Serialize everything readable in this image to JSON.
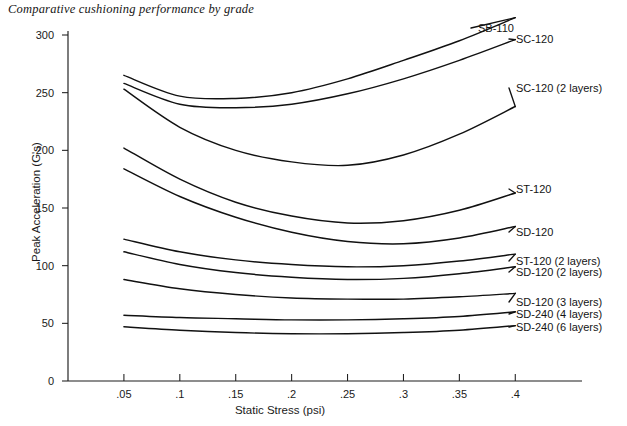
{
  "chart_data": {
    "type": "line",
    "title": "Comparative cushioning performance by grade",
    "xlabel": "Static Stress (psi)",
    "ylabel": "Peak Acceleration (G's)",
    "xlim": [
      0,
      0.44
    ],
    "ylim": [
      0,
      310
    ],
    "xticks": [
      0.05,
      0.1,
      0.15,
      0.2,
      0.25,
      0.3,
      0.35,
      0.4
    ],
    "xticklabels": [
      ".05",
      ".1",
      ".15",
      ".2",
      ".25",
      ".3",
      ".35",
      ".4"
    ],
    "yticks": [
      0,
      50,
      100,
      150,
      200,
      250,
      300
    ],
    "yticklabels": [
      "0",
      "50",
      "100",
      "150",
      "200",
      "250",
      "300"
    ],
    "grid": false,
    "legend_position": "right-inline-labels",
    "x": [
      0.05,
      0.1,
      0.15,
      0.2,
      0.25,
      0.3,
      0.35,
      0.4
    ],
    "series": [
      {
        "name": "SB-110",
        "label": "SB-110",
        "values": [
          265,
          247,
          245,
          250,
          262,
          278,
          295,
          315
        ]
      },
      {
        "name": "SC-120",
        "label": "SC-120",
        "values": [
          258,
          240,
          237,
          240,
          249,
          262,
          278,
          296
        ]
      },
      {
        "name": "SC-120 (2 layers)",
        "label": "SC-120 (2 layers)",
        "values": [
          253,
          220,
          200,
          190,
          187,
          196,
          214,
          238
        ]
      },
      {
        "name": "ST-120",
        "label": "ST-120",
        "values": [
          202,
          175,
          155,
          143,
          137,
          139,
          148,
          163
        ]
      },
      {
        "name": "SD-120",
        "label": "SD-120",
        "values": [
          184,
          160,
          142,
          129,
          121,
          119,
          124,
          134
        ]
      },
      {
        "name": "ST-120 (2 layers)",
        "label": "ST-120 (2 layers)",
        "values": [
          123,
          112,
          105,
          101,
          99,
          100,
          104,
          110
        ]
      },
      {
        "name": "SD-120 (2 layers)",
        "label": "SD-120 (2 layers)",
        "values": [
          112,
          101,
          94,
          90,
          88,
          89,
          93,
          99
        ]
      },
      {
        "name": "SD-120 (3 layers)",
        "label": "SD-120 (3 layers)",
        "values": [
          88,
          80,
          75,
          72,
          71,
          71,
          73,
          76
        ]
      },
      {
        "name": "SD-240 (4 layers)",
        "label": "SD-240 (4 layers)",
        "values": [
          57,
          55,
          54,
          53,
          53,
          54,
          56,
          60
        ]
      },
      {
        "name": "SD-240 (6 layers)",
        "label": "SD-240 (6 layers)",
        "values": [
          47,
          44,
          42,
          41,
          41,
          42,
          44,
          48
        ]
      }
    ],
    "label_anchors": [
      {
        "label": "SB-110",
        "x": 478,
        "y": 28
      },
      {
        "label": "SC-120",
        "x": 516,
        "y": 39
      },
      {
        "label": "SC-120 (2 layers)",
        "x": 516,
        "y": 88
      },
      {
        "label": "ST-120",
        "x": 516,
        "y": 189
      },
      {
        "label": "SD-120",
        "x": 516,
        "y": 232
      },
      {
        "label": "ST-120 (2 layers)",
        "x": 516,
        "y": 261
      },
      {
        "label": "SD-120 (2 layers)",
        "x": 516,
        "y": 272
      },
      {
        "label": "SD-120 (3 layers)",
        "x": 516,
        "y": 302
      },
      {
        "label": "SD-240 (4 layers)",
        "x": 516,
        "y": 314
      },
      {
        "label": "SD-240 (6 layers)",
        "x": 516,
        "y": 327
      }
    ],
    "colors": {
      "line": "#111111",
      "axis": "#1d1d1d",
      "text": "#1a1a1a",
      "background": "#ffffff"
    }
  }
}
